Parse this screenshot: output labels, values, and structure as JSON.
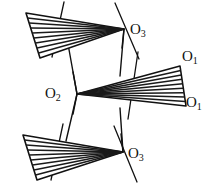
{
  "figure": {
    "background_color": "#ffffff",
    "stroke_color": "#111111",
    "hatch_color": "#1a1a1a",
    "labels": {
      "o3_top": {
        "element": "O",
        "subscript": "3"
      },
      "o2": {
        "element": "O",
        "subscript": "2"
      },
      "o1_top": {
        "element": "O",
        "subscript": "1"
      },
      "o1_bottom": {
        "element": "O",
        "subscript": "1"
      },
      "o3_bottom": {
        "element": "O",
        "subscript": "3"
      }
    },
    "polyhedra": [
      {
        "name": "top-left-wedge",
        "apex": [
          124,
          29
        ],
        "base_top": [
          26,
          13
        ],
        "base_bottom": [
          40,
          58
        ],
        "hatch_lines": 8
      },
      {
        "name": "right-wedge",
        "apex": [
          77,
          94
        ],
        "base_top": [
          180,
          66
        ],
        "base_bottom": [
          186,
          106
        ],
        "hatch_lines": 8
      },
      {
        "name": "bottom-left-wedge",
        "apex": [
          123,
          152
        ],
        "base_top": [
          23,
          135
        ],
        "base_bottom": [
          37,
          180
        ],
        "hatch_lines": 8
      }
    ],
    "bonds": [
      {
        "name": "bond-topwedge-to-o2",
        "from": [
          68,
          44
        ],
        "to": [
          77,
          94
        ]
      },
      {
        "name": "bond-o3top-to-rightwedge",
        "from": [
          124,
          29
        ],
        "to": [
          120,
          76
        ]
      },
      {
        "name": "bond-o2-to-bottomwedge",
        "from": [
          77,
          94
        ],
        "to": [
          66,
          141
        ]
      },
      {
        "name": "bond-rightwedge-to-o3bot",
        "from": [
          120,
          108
        ],
        "to": [
          123,
          152
        ]
      }
    ],
    "axis_lines": [
      {
        "name": "axis-through-top-left-wedge",
        "from": [
          64,
          2
        ],
        "to": [
          52,
          57
        ]
      },
      {
        "name": "axis-through-o3-top",
        "from": [
          115,
          3
        ],
        "to": [
          139,
          59
        ]
      },
      {
        "name": "axis-through-right-wedge",
        "from": [
          138,
          52
        ],
        "to": [
          128,
          119
        ]
      },
      {
        "name": "axis-through-bottom-left-wedge",
        "from": [
          63,
          124
        ],
        "to": [
          51,
          180
        ]
      },
      {
        "name": "axis-through-o3-bottom",
        "from": [
          114,
          126
        ],
        "to": [
          137,
          182
        ]
      }
    ]
  }
}
